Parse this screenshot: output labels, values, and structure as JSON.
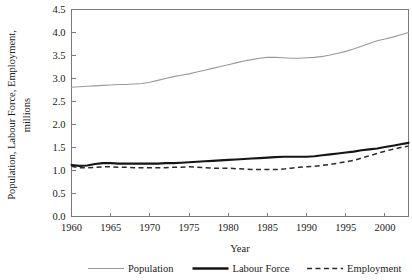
{
  "chart_data": {
    "type": "line",
    "title": "",
    "xlabel": "Year",
    "ylabel": "Population, Labour Force, Employment, millions",
    "ylabel_line1": "Population, Labour Force, Employment,",
    "ylabel_line2": "millions",
    "xlim": [
      1960,
      2003
    ],
    "ylim": [
      0.0,
      4.5
    ],
    "grid": false,
    "legend_position": "bottom",
    "xticks": [
      1960,
      1965,
      1970,
      1975,
      1980,
      1985,
      1990,
      1995,
      2000
    ],
    "xtick_labels": [
      "1960",
      "1965",
      "1970",
      "1975",
      "1980",
      "1985",
      "1990",
      "1995",
      "2000"
    ],
    "yticks": [
      0.0,
      0.5,
      1.0,
      1.5,
      2.0,
      2.5,
      3.0,
      3.5,
      4.0,
      4.5
    ],
    "ytick_labels": [
      "0.0",
      "0.5",
      "1.0",
      "1.5",
      "2.0",
      "2.5",
      "3.0",
      "3.5",
      "4.0",
      "4.5"
    ],
    "x": [
      1960,
      1961,
      1962,
      1963,
      1964,
      1965,
      1966,
      1967,
      1968,
      1969,
      1970,
      1971,
      1972,
      1973,
      1974,
      1975,
      1976,
      1977,
      1978,
      1979,
      1980,
      1981,
      1982,
      1983,
      1984,
      1985,
      1986,
      1987,
      1988,
      1989,
      1990,
      1991,
      1992,
      1993,
      1994,
      1995,
      1996,
      1997,
      1998,
      1999,
      2000,
      2001,
      2002,
      2003
    ],
    "series": [
      {
        "name": "Population",
        "style": "solid-thin-gray",
        "color": "#9a9a9a",
        "values": [
          2.81,
          2.82,
          2.83,
          2.84,
          2.85,
          2.86,
          2.87,
          2.87,
          2.88,
          2.89,
          2.92,
          2.96,
          3.0,
          3.04,
          3.07,
          3.1,
          3.14,
          3.18,
          3.22,
          3.26,
          3.3,
          3.34,
          3.38,
          3.41,
          3.44,
          3.46,
          3.46,
          3.45,
          3.44,
          3.44,
          3.45,
          3.46,
          3.48,
          3.51,
          3.55,
          3.59,
          3.64,
          3.7,
          3.76,
          3.82,
          3.86,
          3.9,
          3.95,
          4.0
        ]
      },
      {
        "name": "Labour Force",
        "style": "solid-thick-black",
        "color": "#151515",
        "values": [
          1.12,
          1.1,
          1.11,
          1.14,
          1.16,
          1.16,
          1.15,
          1.15,
          1.15,
          1.15,
          1.15,
          1.15,
          1.16,
          1.16,
          1.17,
          1.18,
          1.19,
          1.2,
          1.21,
          1.22,
          1.23,
          1.24,
          1.25,
          1.26,
          1.27,
          1.28,
          1.29,
          1.3,
          1.3,
          1.3,
          1.3,
          1.31,
          1.33,
          1.35,
          1.37,
          1.39,
          1.41,
          1.44,
          1.46,
          1.48,
          1.51,
          1.54,
          1.57,
          1.6
        ]
      },
      {
        "name": "Employment",
        "style": "dashed-black",
        "color": "#2a2a2a",
        "values": [
          1.09,
          1.06,
          1.06,
          1.07,
          1.08,
          1.08,
          1.07,
          1.07,
          1.06,
          1.06,
          1.06,
          1.06,
          1.06,
          1.07,
          1.07,
          1.08,
          1.07,
          1.06,
          1.05,
          1.05,
          1.05,
          1.04,
          1.03,
          1.02,
          1.02,
          1.02,
          1.02,
          1.03,
          1.05,
          1.07,
          1.08,
          1.09,
          1.11,
          1.13,
          1.16,
          1.19,
          1.22,
          1.27,
          1.32,
          1.37,
          1.42,
          1.46,
          1.5,
          1.53
        ]
      }
    ],
    "legend": [
      {
        "label": "Population",
        "swatch": "solid-thin-gray"
      },
      {
        "label": "Labour Force",
        "swatch": "solid-thick-black"
      },
      {
        "label": "Employment",
        "swatch": "dashed-black"
      }
    ]
  }
}
